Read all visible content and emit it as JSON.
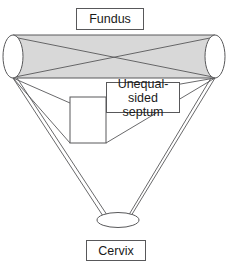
{
  "figure": {
    "title_label": "Fundus",
    "bottom_label": "Cervix",
    "annotation_label": "Unequal-\nsided septum",
    "type": "anatomical-diagram",
    "colors": {
      "fundus_fill": "#d8d8d8",
      "outline": "#58585a",
      "background": "#ffffff",
      "text": "#1a1a1a",
      "horn_fill": "#ffffff"
    },
    "geometry": {
      "left_horn": {
        "cx": 13,
        "cy": 56.5,
        "rx": 10,
        "ry": 21.5
      },
      "right_horn": {
        "cx": 215,
        "cy": 56.5,
        "rx": 10,
        "ry": 21.5
      },
      "cervix": {
        "cx": 118,
        "cy": 220,
        "rx": 21,
        "ry": 7.5
      },
      "fundus_band": {
        "x1": 13,
        "y1": 35,
        "x2": 215,
        "y2": 78
      },
      "septum_box": {
        "x": 70,
        "y": 97,
        "w": 36,
        "h": 46
      }
    }
  }
}
